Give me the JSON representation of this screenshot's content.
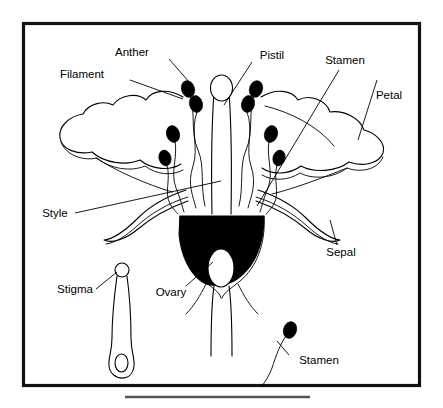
{
  "figure": {
    "kind": "botanical-line-diagram",
    "ink_color": "#000000",
    "background_color": "#ffffff",
    "frame_color": "#111111",
    "rule_color": "#555555"
  },
  "labels": {
    "anther": "Anther",
    "filament": "Filament",
    "pistil": "Pistil",
    "stamen_upper": "Stamen",
    "petal": "Petal",
    "style": "Style",
    "sepal": "Sepal",
    "stigma": "Stigma",
    "ovary": "Ovary",
    "stamen_lower": "Stamen"
  },
  "parts": [
    {
      "name": "anther",
      "label": "Anther",
      "count": 8,
      "fill": "#000000",
      "description": "black oval pollen sacs at filament tips"
    },
    {
      "name": "filament",
      "label": "Filament",
      "count": 8,
      "fill": "none",
      "description": "slender curving stalks supporting anthers"
    },
    {
      "name": "pistil",
      "label": "Pistil",
      "count": 1,
      "fill": "none",
      "description": "central female structure: stigma, style, ovary"
    },
    {
      "name": "stamen",
      "label": "Stamen",
      "count": 8,
      "fill": "none",
      "description": "anther plus filament; male reproductive unit"
    },
    {
      "name": "petal",
      "label": "Petal",
      "count": 2,
      "fill": "none",
      "description": "broad lobed corolla lobes flanking the center"
    },
    {
      "name": "style",
      "label": "Style",
      "count": 1,
      "fill": "none",
      "description": "column connecting stigma to ovary"
    },
    {
      "name": "sepal",
      "label": "Sepal",
      "count": 2,
      "fill": "none",
      "description": "narrow recurved bracts below the petals"
    },
    {
      "name": "stigma",
      "label": "Stigma",
      "count": 1,
      "fill": "#ffffff",
      "description": "rounded pollen-receptive tip of the pistil"
    },
    {
      "name": "ovary",
      "label": "Ovary",
      "count": 1,
      "fill": "#000000",
      "description": "black basal chamber enclosing a white ovule cavity"
    }
  ],
  "insets": [
    {
      "name": "pistil-detail",
      "label": "Stigma",
      "description": "isolated pistil at lower left: round stigma, long style, bulbous ovary"
    },
    {
      "name": "stamen-detail",
      "label": "Stamen",
      "description": "isolated stamen at lower right: curved filament with black anther"
    }
  ]
}
